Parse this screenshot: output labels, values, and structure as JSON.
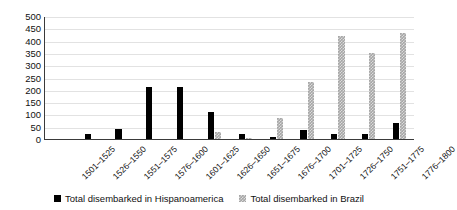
{
  "chart_data": {
    "type": "bar",
    "title": "",
    "xlabel": "",
    "ylabel": "Thousands",
    "ylim": [
      0,
      500
    ],
    "ytick_step": 50,
    "yticks": [
      500,
      450,
      400,
      350,
      300,
      250,
      200,
      150,
      100,
      50,
      0
    ],
    "grid": true,
    "legend_position": "bottom",
    "categories": [
      "1501–1525",
      "1526–1550",
      "1551–1575",
      "1576–1600",
      "1601–1625",
      "1626–1650",
      "1651–1675",
      "1676–1700",
      "1701–1725",
      "1726–1750",
      "1751–1775",
      "1776–1800"
    ],
    "series": [
      {
        "name": "Total disembarked in Hispanoamerica",
        "color": "#000000",
        "values": [
          0,
          22,
          42,
          212,
          212,
          110,
          22,
          8,
          36,
          20,
          20,
          64
        ]
      },
      {
        "name": "Total disembarked in Brazil",
        "color": "#a6a6a6",
        "values": [
          0,
          0,
          0,
          0,
          0,
          30,
          3,
          84,
          232,
          418,
          350,
          430
        ]
      }
    ]
  },
  "legend": {
    "items": [
      {
        "label": "Total disembarked in Hispanoamerica",
        "swatch": "black-square-icon"
      },
      {
        "label": "Total disembarked in Brazil",
        "swatch": "gray-square-icon"
      }
    ]
  }
}
